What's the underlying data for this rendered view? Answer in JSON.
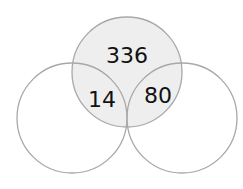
{
  "diagram": {
    "type": "venn-3",
    "colors": {
      "stroke": "#a8a8a8",
      "highlight_fill": "#eeeeee",
      "background": "#ffffff",
      "text": "#111111"
    },
    "circles": [
      {
        "id": "top",
        "cx": 127,
        "cy": 72,
        "r": 55,
        "shaded": true
      },
      {
        "id": "left",
        "cx": 72,
        "cy": 118,
        "r": 55,
        "shaded": false
      },
      {
        "id": "right",
        "cx": 182,
        "cy": 118,
        "r": 55,
        "shaded": false
      }
    ],
    "labels": {
      "top_only": "336",
      "top_left": "14",
      "top_right": "80"
    }
  }
}
